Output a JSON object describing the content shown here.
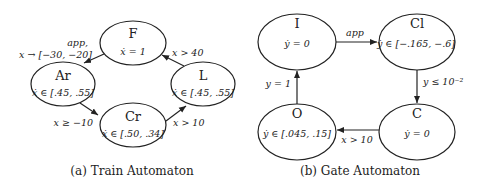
{
  "figures": [
    {
      "caption": "(a) Train Automaton",
      "states": [
        {
          "id": "F",
          "name": "F",
          "flow": "ẋ = 1"
        },
        {
          "id": "Ar",
          "name": "Ar",
          "flow": "ẋ ∈ [.45, .55]"
        },
        {
          "id": "L",
          "name": "L",
          "flow": "ẋ ∈ [.45, .55]"
        },
        {
          "id": "Cr",
          "name": "Cr",
          "flow": "ẋ ∈ [.50, .34]"
        }
      ],
      "transitions": [
        {
          "from": "F",
          "to": "Ar",
          "label_line1": "app,",
          "label_line2": "x → [−30, −20]"
        },
        {
          "from": "Ar",
          "to": "Cr",
          "label": "x ≥ −10"
        },
        {
          "from": "Cr",
          "to": "L",
          "label": "x > 10"
        },
        {
          "from": "L",
          "to": "F",
          "label": "x > 40"
        }
      ]
    },
    {
      "caption": "(b) Gate Automaton",
      "states": [
        {
          "id": "I",
          "name": "I",
          "flow": "ẏ = 0"
        },
        {
          "id": "Cl",
          "name": "Cl",
          "flow": "ẏ ∈ [−.165, −.6]"
        },
        {
          "id": "C",
          "name": "C",
          "flow": "ẏ = 0"
        },
        {
          "id": "O",
          "name": "O",
          "flow": "ẏ ∈ [.045, .15]"
        }
      ],
      "transitions": [
        {
          "from": "I",
          "to": "Cl",
          "label": "app"
        },
        {
          "from": "Cl",
          "to": "C",
          "label": "y ≤ 10⁻²"
        },
        {
          "from": "C",
          "to": "O",
          "label": "x > 10"
        },
        {
          "from": "O",
          "to": "I",
          "label": "y = 1"
        }
      ]
    }
  ]
}
